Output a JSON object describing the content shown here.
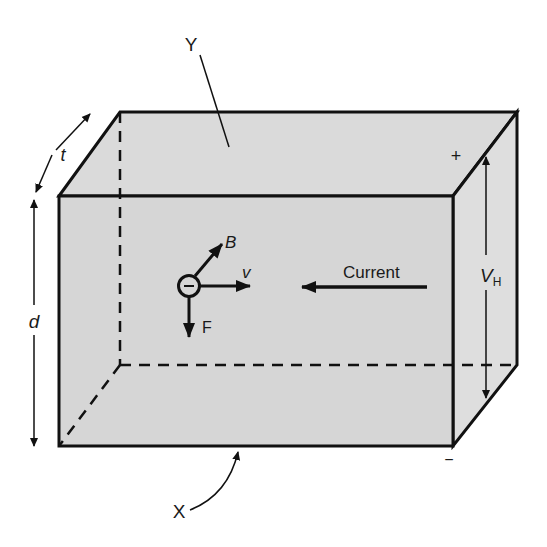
{
  "figure": {
    "colors": {
      "face_fill": "#d9d9d9",
      "side_fill": "#dcdcdc",
      "stroke": "#111111",
      "background": "#ffffff"
    }
  },
  "labels": {
    "top_face": "Y",
    "bottom_face": "X",
    "thickness": "t",
    "depth": "d",
    "hall_voltage_main": "V",
    "hall_voltage_sub": "H",
    "plus": "+",
    "minus": "−",
    "magnetic_field": "B",
    "velocity": "v",
    "force": "F",
    "current": "Current",
    "charge": "−"
  }
}
